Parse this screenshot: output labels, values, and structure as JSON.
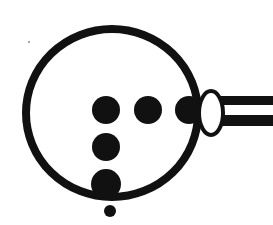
{
  "figure": {
    "description": "A thick circular ring outline containing five solid black dots, with a small white outlined ellipse attached at the right side of the ring and a two-bar rod extending to the right edge.",
    "background_color": "#ffffff",
    "ink_color": "#111111",
    "canvas": {
      "width": 273,
      "height": 225
    }
  },
  "elements": {
    "ring": {
      "name": "large-circle-outline",
      "center_x": 112,
      "center_y": 113,
      "radius_x": 86,
      "radius_y": 84,
      "stroke_width": 8,
      "fill": "none"
    },
    "ellipse": {
      "name": "white-ellipse",
      "center_x": 211,
      "center_y": 113,
      "radius_x": 12,
      "radius_y": 22,
      "stroke_width": 4,
      "fill": "#ffffff"
    },
    "rod": {
      "name": "handle-rod",
      "bars": [
        {
          "x": 219,
          "y": 96,
          "width": 54,
          "height": 9
        },
        {
          "x": 219,
          "y": 115,
          "width": 54,
          "height": 11
        }
      ]
    },
    "speck": {
      "name": "stray-speck",
      "x": 29,
      "y": 42,
      "radius": 1.2,
      "opacity": 0.35
    }
  },
  "chart_data": {
    "type": "scatter",
    "xlabel": "",
    "ylabel": "",
    "xlim": [
      0,
      273
    ],
    "ylim": [
      0,
      225
    ],
    "grid": false,
    "legend": "none",
    "series": [
      {
        "name": "dots",
        "points": [
          {
            "label": "row-dot-left",
            "x": 106,
            "y": 110,
            "r": 14
          },
          {
            "label": "row-dot-middle",
            "x": 148,
            "y": 110,
            "r": 14
          },
          {
            "label": "row-dot-right",
            "x": 189,
            "y": 110,
            "r": 14
          },
          {
            "label": "column-dot-mid",
            "x": 106,
            "y": 147,
            "r": 14
          },
          {
            "label": "column-dot-low",
            "x": 106,
            "y": 184,
            "r": 15
          },
          {
            "label": "tiny-dot-bottom",
            "x": 110,
            "y": 211,
            "r": 6
          }
        ]
      }
    ]
  },
  "annotations": {
    "dot_count_label": "6",
    "shape_label": "circle"
  }
}
